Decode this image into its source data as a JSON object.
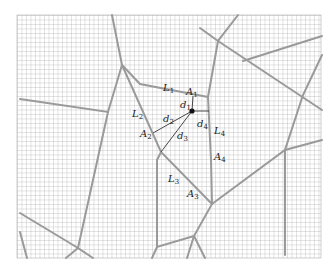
{
  "figure": {
    "type": "voronoi-grid-diagram",
    "grid": {
      "x0": 17,
      "y0": 15,
      "x1": 321,
      "y1": 258,
      "spacing": 4.5,
      "color": "#9a9a9a"
    },
    "colors": {
      "edge": "#9c9c9c",
      "measure_line": "#333333",
      "point": "#111111"
    },
    "point": {
      "x": 192,
      "y": 111
    },
    "labels": [
      {
        "id": "L1",
        "base": "L",
        "sub": "1",
        "x": 163,
        "y": 91
      },
      {
        "id": "A1",
        "base": "A",
        "sub": "1",
        "x": 186,
        "y": 95
      },
      {
        "id": "d1",
        "base": "d",
        "sub": "1",
        "x": 180,
        "y": 108
      },
      {
        "id": "L2",
        "base": "L",
        "sub": "2",
        "x": 132,
        "y": 117
      },
      {
        "id": "d2",
        "base": "d",
        "sub": "2",
        "x": 163,
        "y": 122
      },
      {
        "id": "d4",
        "base": "d",
        "sub": "4",
        "x": 197,
        "y": 127
      },
      {
        "id": "A2",
        "base": "A",
        "sub": "2",
        "x": 140,
        "y": 137
      },
      {
        "id": "d3",
        "base": "d",
        "sub": "3",
        "x": 177,
        "y": 139
      },
      {
        "id": "L4",
        "base": "L",
        "sub": "4",
        "x": 214,
        "y": 134
      },
      {
        "id": "A4",
        "base": "A",
        "sub": "4",
        "x": 214,
        "y": 160
      },
      {
        "id": "L3",
        "base": "L",
        "sub": "3",
        "x": 168,
        "y": 182
      },
      {
        "id": "A3",
        "base": "A",
        "sub": "3",
        "x": 187,
        "y": 197
      }
    ]
  }
}
